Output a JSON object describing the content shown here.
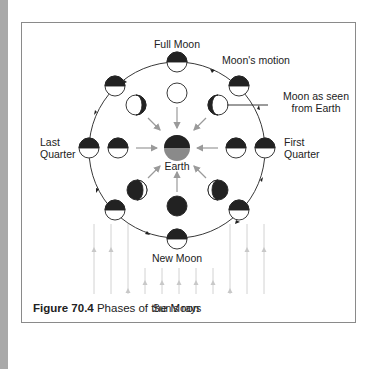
{
  "figure": {
    "number": "Figure 70.4",
    "title": "Phases of the Moon"
  },
  "labels": {
    "full_moon": "Full Moon",
    "moons_motion": "Moon's motion",
    "moon_as_seen_line1": "Moon as seen",
    "moon_as_seen_line2": "from Earth",
    "last_quarter_line1": "Last",
    "last_quarter_line2": "Quarter",
    "first_quarter_line1": "First",
    "first_quarter_line2": "Quarter",
    "earth": "Earth",
    "new_moon": "New Moon",
    "suns_rays": "Sun's rays"
  },
  "colors": {
    "dark": "#222222",
    "earth_lit": "#8a8a8a",
    "rays": "#cfcfcf",
    "earth_arrows": "#9a9a9a",
    "frame": "#8a8a8a"
  }
}
